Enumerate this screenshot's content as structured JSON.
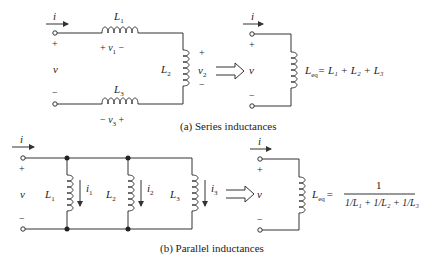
{
  "series": {
    "caption": "(a) Series inductances",
    "current": "i",
    "voltage": "v",
    "plus": "+",
    "minus": "−",
    "L1": "L",
    "L1_sub": "1",
    "L2": "L",
    "L2_sub": "2",
    "L3": "L",
    "L3_sub": "3",
    "v1": "v",
    "v1_sub": "1",
    "v2": "v",
    "v2_sub": "2",
    "v3": "v",
    "v3_sub": "3",
    "eq_lhs": "L",
    "eq_lhs_sub": "eq",
    "eq_rhs": "= L₁ + L₂ + L₃"
  },
  "parallel": {
    "caption": "(b) Parallel inductances",
    "current": "i",
    "voltage": "v",
    "plus": "+",
    "minus": "−",
    "L1": "L",
    "L1_sub": "1",
    "L2": "L",
    "L2_sub": "2",
    "L3": "L",
    "L3_sub": "3",
    "i1": "i",
    "i1_sub": "1",
    "i2": "i",
    "i2_sub": "2",
    "i3": "i",
    "i3_sub": "3",
    "eq_lhs": "L",
    "eq_lhs_sub": "eq",
    "eq_equals": "=",
    "eq_numerator": "1",
    "eq_denominator": "1/L₁ + 1/L₂ + 1/L₃"
  },
  "colors": {
    "wire": "#333333",
    "text": "#222222",
    "background": "#ffffff"
  }
}
